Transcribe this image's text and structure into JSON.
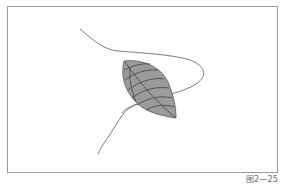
{
  "figure": {
    "caption": "图2—25",
    "colors": {
      "frame": "#9a9a9a",
      "leaf_fill": "#9b9b9b",
      "veins": "#4a4a4a",
      "vine": "#6e6e6e",
      "background": "#ffffff",
      "caption": "#666666"
    }
  }
}
